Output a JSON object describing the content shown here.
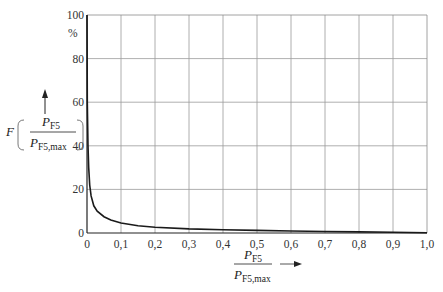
{
  "chart_data": {
    "type": "line",
    "title": "",
    "xlabel": "P_F5 / P_F5,max",
    "ylabel": "F(P_F5 / P_F5,max)",
    "yunit": "%",
    "xlim": [
      0,
      1.0
    ],
    "ylim": [
      0,
      100
    ],
    "grid": true,
    "legend": null,
    "x_ticks": [
      "0",
      "0,1",
      "0,2",
      "0,3",
      "0,4",
      "0,5",
      "0,6",
      "0,7",
      "0,8",
      "0,9",
      "1,0"
    ],
    "y_ticks": [
      "0",
      "20",
      "40",
      "60",
      "80",
      "100"
    ],
    "series": [
      {
        "name": "F",
        "x": [
          0.0,
          0.001,
          0.003,
          0.005,
          0.008,
          0.012,
          0.02,
          0.03,
          0.05,
          0.07,
          0.1,
          0.15,
          0.2,
          0.3,
          0.4,
          0.5,
          0.6,
          0.7,
          0.8,
          0.9,
          1.0
        ],
        "y": [
          100,
          60,
          40,
          30,
          22,
          17,
          12.5,
          10,
          7.5,
          6,
          4.6,
          3.3,
          2.6,
          1.9,
          1.5,
          1.2,
          0.9,
          0.7,
          0.5,
          0.3,
          0.1
        ]
      }
    ]
  },
  "axes": {
    "y_label_main": "F",
    "y_label_num": "P",
    "y_label_num_sub": "F5",
    "y_label_den": "P",
    "y_label_den_sub": "F5,max",
    "y_unit": "%",
    "x_label_num": "P",
    "x_label_num_sub": "F5",
    "x_label_den": "P",
    "x_label_den_sub": "F5,max"
  }
}
